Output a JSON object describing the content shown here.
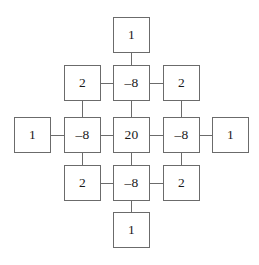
{
  "figure": {
    "kind": "node-lattice-diagram",
    "shape": "diamond-cross",
    "background_color": "#ffffff",
    "box_border_color": "#6b6b6b",
    "connector_color": "#6b6b6b",
    "text_color": "#1a1a1a",
    "node_count": 13,
    "connector_count": 16
  },
  "nodes": [
    {
      "id": "n-top",
      "label": "1",
      "x": 113,
      "y": 17,
      "row": 0,
      "col": 2
    },
    {
      "id": "n-r1-left",
      "label": "2",
      "x": 64,
      "y": 65,
      "row": 1,
      "col": 1
    },
    {
      "id": "n-r1-center",
      "label": "–8",
      "x": 113,
      "y": 65,
      "row": 1,
      "col": 2
    },
    {
      "id": "n-r1-right",
      "label": "2",
      "x": 163,
      "y": 65,
      "row": 1,
      "col": 3
    },
    {
      "id": "n-r2-farleft",
      "label": "1",
      "x": 14,
      "y": 117,
      "row": 2,
      "col": 0
    },
    {
      "id": "n-r2-left",
      "label": "–8",
      "x": 64,
      "y": 117,
      "row": 2,
      "col": 1
    },
    {
      "id": "n-r2-center",
      "label": "20",
      "x": 113,
      "y": 117,
      "row": 2,
      "col": 2
    },
    {
      "id": "n-r2-right",
      "label": "–8",
      "x": 163,
      "y": 117,
      "row": 2,
      "col": 3
    },
    {
      "id": "n-r2-farright",
      "label": "1",
      "x": 212,
      "y": 117,
      "row": 2,
      "col": 4
    },
    {
      "id": "n-r3-left",
      "label": "2",
      "x": 64,
      "y": 165,
      "row": 3,
      "col": 1
    },
    {
      "id": "n-r3-center",
      "label": "–8",
      "x": 113,
      "y": 165,
      "row": 3,
      "col": 2
    },
    {
      "id": "n-r3-right",
      "label": "2",
      "x": 163,
      "y": 165,
      "row": 3,
      "col": 3
    },
    {
      "id": "n-bottom",
      "label": "1",
      "x": 113,
      "y": 212,
      "row": 4,
      "col": 2
    }
  ],
  "connectors": [
    {
      "id": "c-top-to-r1center",
      "orientation": "vertical",
      "x1": 131.5,
      "y1": 53,
      "x2": 131.5,
      "y2": 65
    },
    {
      "id": "c-r1left-to-r1center",
      "orientation": "horizontal",
      "x1": 101,
      "y1": 83,
      "x2": 113,
      "y2": 83
    },
    {
      "id": "c-r1center-to-r1right",
      "orientation": "horizontal",
      "x1": 150,
      "y1": 83,
      "x2": 163,
      "y2": 83
    },
    {
      "id": "c-r1left-to-r2left",
      "orientation": "vertical",
      "x1": 82.5,
      "y1": 101,
      "x2": 82.5,
      "y2": 117
    },
    {
      "id": "c-r1center-to-r2center",
      "orientation": "vertical",
      "x1": 131.5,
      "y1": 101,
      "x2": 131.5,
      "y2": 117
    },
    {
      "id": "c-r1right-to-r2right",
      "orientation": "vertical",
      "x1": 181.5,
      "y1": 101,
      "x2": 181.5,
      "y2": 117
    },
    {
      "id": "c-farleft-to-r2left",
      "orientation": "horizontal",
      "x1": 51,
      "y1": 135,
      "x2": 64,
      "y2": 135
    },
    {
      "id": "c-r2left-to-r2center",
      "orientation": "horizontal",
      "x1": 101,
      "y1": 135,
      "x2": 113,
      "y2": 135
    },
    {
      "id": "c-r2center-to-r2right",
      "orientation": "horizontal",
      "x1": 150,
      "y1": 135,
      "x2": 163,
      "y2": 135
    },
    {
      "id": "c-r2right-to-farright",
      "orientation": "horizontal",
      "x1": 200,
      "y1": 135,
      "x2": 212,
      "y2": 135
    },
    {
      "id": "c-r2left-to-r3left",
      "orientation": "vertical",
      "x1": 82.5,
      "y1": 153,
      "x2": 82.5,
      "y2": 165
    },
    {
      "id": "c-r2center-to-r3center",
      "orientation": "vertical",
      "x1": 131.5,
      "y1": 153,
      "x2": 131.5,
      "y2": 165
    },
    {
      "id": "c-r2right-to-r3right",
      "orientation": "vertical",
      "x1": 181.5,
      "y1": 153,
      "x2": 181.5,
      "y2": 165
    },
    {
      "id": "c-r3left-to-r3center",
      "orientation": "horizontal",
      "x1": 101,
      "y1": 183,
      "x2": 113,
      "y2": 183
    },
    {
      "id": "c-r3center-to-r3right",
      "orientation": "horizontal",
      "x1": 150,
      "y1": 183,
      "x2": 163,
      "y2": 183
    },
    {
      "id": "c-r3center-to-bottom",
      "orientation": "vertical",
      "x1": 131.5,
      "y1": 201,
      "x2": 131.5,
      "y2": 212
    }
  ]
}
